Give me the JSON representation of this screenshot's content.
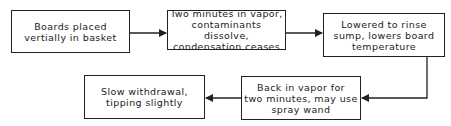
{
  "diagram": {
    "type": "flowchart",
    "nodes": [
      {
        "id": "n1",
        "text": "Boards placed\nvertially in basket"
      },
      {
        "id": "n2",
        "text": "Two minutes in vapor,\ncontaminants dissolve,\ncondensation ceases"
      },
      {
        "id": "n3",
        "text": "Lowered to rinse\nsump, lowers board\ntemperature"
      },
      {
        "id": "n4",
        "text": "Back in vapor for\ntwo minutes, may use\nspray wand"
      },
      {
        "id": "n5",
        "text": "Slow withdrawal,\ntipping slightly"
      }
    ],
    "edges": [
      {
        "from": "n1",
        "to": "n2"
      },
      {
        "from": "n2",
        "to": "n3"
      },
      {
        "from": "n3",
        "to": "n4"
      },
      {
        "from": "n4",
        "to": "n5"
      }
    ],
    "colors": {
      "line": "#222222",
      "background": "#ffffff"
    }
  }
}
